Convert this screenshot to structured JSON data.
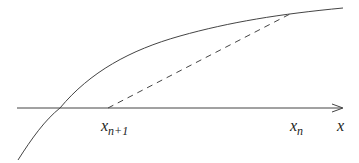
{
  "diagram": {
    "type": "newton-secant-iteration",
    "colors": {
      "line": "#444444",
      "background": "#ffffff"
    },
    "axis": {
      "label": "x"
    },
    "points": [
      {
        "name": "x_n+1",
        "base": "x",
        "subscript": "n+1"
      },
      {
        "name": "x_n",
        "base": "x",
        "subscript": "n"
      }
    ],
    "curve": {
      "style": "solid"
    },
    "tangent_line": {
      "style": "dashed"
    }
  }
}
